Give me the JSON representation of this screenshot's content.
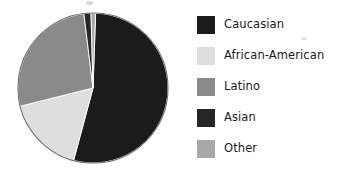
{
  "chart_data": {
    "type": "pie",
    "title": "",
    "subtitle": "",
    "xlabel": "",
    "ylabel": "",
    "legend_position": "right",
    "grid": false,
    "start_angle_deg": 0,
    "direction": "clockwise",
    "categories": [
      "Caucasian",
      "African-American",
      "Latino",
      "Asian",
      "Other"
    ],
    "values": [
      54,
      17,
      27,
      1.5,
      0.5
    ],
    "units": "percent",
    "slices": [
      {
        "label": "Caucasian",
        "value": 54,
        "color": "#1b1b1b",
        "start_deg": 2,
        "end_deg": 195
      },
      {
        "label": "African-American",
        "value": 17,
        "color": "#dedede",
        "start_deg": 195,
        "end_deg": 256
      },
      {
        "label": "Latino",
        "value": 27,
        "color": "#8a8a8a",
        "start_deg": 256,
        "end_deg": 353
      },
      {
        "label": "Asian",
        "value": 1.5,
        "color": "#262626",
        "start_deg": 353,
        "end_deg": 358.5
      },
      {
        "label": "Other",
        "value": 0.5,
        "color": "#a8a8a8",
        "start_deg": 358.5,
        "end_deg": 362
      }
    ]
  },
  "legend": {
    "items": [
      {
        "label": "Caucasian",
        "color": "#1b1b1b"
      },
      {
        "label": "African-American",
        "color": "#dedede"
      },
      {
        "label": "Latino",
        "color": "#8a8a8a"
      },
      {
        "label": "Asian",
        "color": "#262626"
      },
      {
        "label": "Other",
        "color": "#a8a8a8"
      }
    ]
  },
  "geometry": {
    "center_x": 93,
    "center_y": 88,
    "radius": 75,
    "outline_color": "#6e6e6e"
  }
}
